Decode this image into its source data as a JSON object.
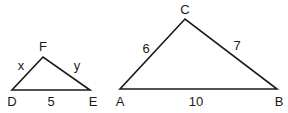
{
  "diagram": {
    "stroke_color": "#1a1a1a",
    "triangles": [
      {
        "name": "DEF",
        "vertices": [
          {
            "label": "D",
            "x": 12,
            "y": 90,
            "lx": 12,
            "ly": 106
          },
          {
            "label": "E",
            "x": 90,
            "y": 90,
            "lx": 93,
            "ly": 106
          },
          {
            "label": "F",
            "x": 43,
            "y": 57,
            "lx": 43,
            "ly": 51
          }
        ],
        "sides": [
          {
            "between": "DF",
            "label": "x",
            "lx": 21,
            "ly": 70
          },
          {
            "between": "EF",
            "label": "y",
            "lx": 77,
            "ly": 70
          },
          {
            "between": "DE",
            "label": "5",
            "lx": 51,
            "ly": 106
          }
        ]
      },
      {
        "name": "ABC",
        "vertices": [
          {
            "label": "A",
            "x": 120,
            "y": 89,
            "lx": 120,
            "ly": 106
          },
          {
            "label": "B",
            "x": 277,
            "y": 89,
            "lx": 279,
            "ly": 106
          },
          {
            "label": "C",
            "x": 185,
            "y": 19,
            "lx": 185,
            "ly": 14
          }
        ],
        "sides": [
          {
            "between": "AC",
            "label": "6",
            "lx": 146,
            "ly": 53
          },
          {
            "between": "BC",
            "label": "7",
            "lx": 237,
            "ly": 50
          },
          {
            "between": "AB",
            "label": "10",
            "lx": 196,
            "ly": 106
          }
        ]
      }
    ]
  }
}
